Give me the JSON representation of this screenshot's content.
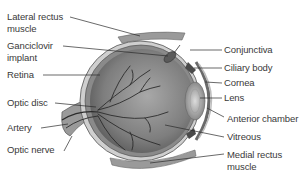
{
  "diagram": {
    "left_labels": [
      {
        "id": "lateral-rectus-muscle",
        "line1": "Lateral rectus",
        "line2": "muscle"
      },
      {
        "id": "ganciclovir-implant",
        "line1": "Ganciclovir",
        "line2": "implant"
      },
      {
        "id": "retina",
        "line1": "Retina"
      },
      {
        "id": "optic-disc",
        "line1": "Optic disc"
      },
      {
        "id": "artery",
        "line1": "Artery"
      },
      {
        "id": "optic-nerve",
        "line1": "Optic nerve"
      }
    ],
    "right_labels": [
      {
        "id": "conjunctiva",
        "line1": "Conjunctiva"
      },
      {
        "id": "ciliary-body",
        "line1": "Ciliary body"
      },
      {
        "id": "cornea",
        "line1": "Cornea"
      },
      {
        "id": "lens",
        "line1": "Lens"
      },
      {
        "id": "anterior-chamber",
        "line1": "Anterior chamber"
      },
      {
        "id": "vitreous",
        "line1": "Vitreous"
      },
      {
        "id": "medial-rectus-muscle",
        "line1": "Medial rectus",
        "line2": "muscle"
      }
    ],
    "colors": {
      "background": "#ffffff",
      "text": "#3a3a3a",
      "leader_line": "#2a2a2a",
      "eyeball_fill": "#8c8c8c",
      "sclera": "#c8c8c8",
      "vessels": "#2b2b2b"
    }
  }
}
